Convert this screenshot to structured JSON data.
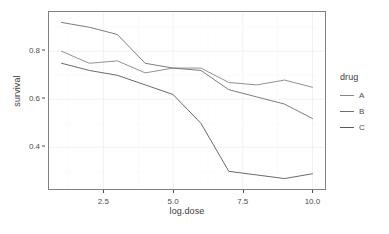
{
  "chart_data": {
    "type": "line",
    "title": "",
    "xlabel": "log.dose",
    "ylabel": "survival",
    "xlim": [
      1,
      10
    ],
    "ylim": [
      0.26,
      0.93
    ],
    "grid": true,
    "legend_position": "right",
    "legend_title": "drug",
    "x": [
      1,
      2,
      3,
      4,
      5,
      6,
      7,
      8,
      9,
      10
    ],
    "xticks": [
      "2.5",
      "5.0",
      "7.5",
      "10.0"
    ],
    "xtick_values": [
      2.5,
      5.0,
      7.5,
      10.0
    ],
    "yticks": [
      "0.4",
      "0.6",
      "0.8"
    ],
    "ytick_values": [
      0.4,
      0.6,
      0.8
    ],
    "series": [
      {
        "name": "A",
        "color": "#868686",
        "values": [
          0.8,
          0.75,
          0.76,
          0.71,
          0.73,
          0.73,
          0.67,
          0.66,
          0.68,
          0.65
        ]
      },
      {
        "name": "B",
        "color": "#6e6e6e",
        "values": [
          0.92,
          0.9,
          0.87,
          0.75,
          0.73,
          0.72,
          0.64,
          0.61,
          0.58,
          0.52
        ]
      },
      {
        "name": "C",
        "color": "#595959",
        "values": [
          0.75,
          0.72,
          0.7,
          0.66,
          0.62,
          0.5,
          0.3,
          0.285,
          0.27,
          0.29
        ]
      }
    ]
  },
  "axes": {
    "y_title": "survival",
    "x_title": "log.dose"
  },
  "legend": {
    "title": "drug",
    "items": [
      {
        "label": "A"
      },
      {
        "label": "B"
      },
      {
        "label": "C"
      }
    ]
  },
  "colors": {
    "panel_background": "#ffffff",
    "panel_border": "#808080",
    "grid_major": "#ededed",
    "grid_minor": "#f6f6f6",
    "text": "#4d4d4d"
  }
}
